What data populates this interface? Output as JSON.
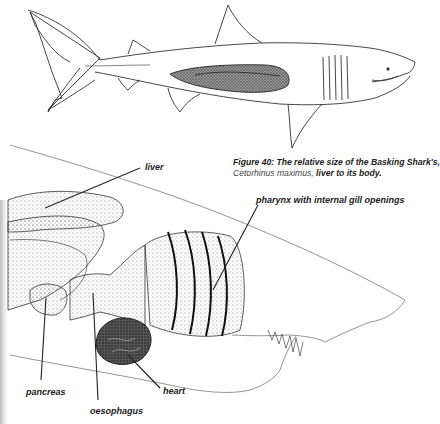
{
  "figure": {
    "caption": {
      "line1_bold": "Figure 40: The relative size of the Basking Shark's,",
      "line2_species": "Cetorhinus maximus",
      "line2_sep": ", ",
      "line2_bold": "liver to its body."
    },
    "labels": {
      "liver": "liver",
      "pharynx": "pharynx with internal gill openings",
      "pancreas": "pancreas",
      "oesophagus": "oesophagus",
      "heart": "heart"
    },
    "colors": {
      "ink": "#222222",
      "stipple": "#555555",
      "background": "#ffffff"
    }
  }
}
